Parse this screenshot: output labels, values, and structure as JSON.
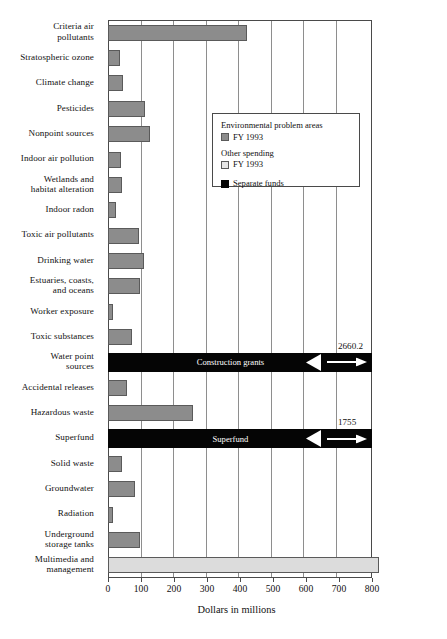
{
  "chart_data": {
    "type": "bar",
    "orientation": "horizontal",
    "title": "",
    "xlabel": "Dollars in millions",
    "ylabel": "",
    "xlim": [
      0,
      800
    ],
    "xticks": [
      0,
      100,
      200,
      300,
      400,
      500,
      600,
      700,
      800
    ],
    "xtick_labels": [
      "0",
      "100",
      "200",
      "300",
      "400",
      "500",
      "600",
      "700",
      "800"
    ],
    "grid": true,
    "legend_position": "upper-right-inside",
    "categories": [
      "Criteria air pollutants",
      "Stratospheric ozone",
      "Climate change",
      "Pesticides",
      "Nonpoint sources",
      "Indoor air pollution",
      "Wetlands and habitat alteration",
      "Indoor radon",
      "Toxic air pollutants",
      "Drinking water",
      "Estuaries, coasts, and oceans",
      "Worker exposure",
      "Toxic substances",
      "Water point sources",
      "Accidental releases",
      "Hazardous waste",
      "Superfund",
      "Solid waste",
      "Groundwater",
      "Radiation",
      "Underground storage tanks",
      "Multimedia and management"
    ],
    "values": [
      420,
      37,
      44,
      113,
      128,
      38,
      42,
      25,
      93,
      110,
      96,
      14,
      74,
      2660.2,
      58,
      258,
      1755,
      43,
      83,
      14,
      97,
      820
    ],
    "bars": [
      {
        "label_lines": [
          "Criteria air",
          "pollutants"
        ],
        "value": 420,
        "style": "dark",
        "broken": false
      },
      {
        "label_lines": [
          "Stratospheric ozone"
        ],
        "value": 37,
        "style": "dark",
        "broken": false
      },
      {
        "label_lines": [
          "Climate change"
        ],
        "value": 44,
        "style": "dark",
        "broken": false
      },
      {
        "label_lines": [
          "Pesticides"
        ],
        "value": 113,
        "style": "dark",
        "broken": false
      },
      {
        "label_lines": [
          "Nonpoint sources"
        ],
        "value": 128,
        "style": "dark",
        "broken": false
      },
      {
        "label_lines": [
          "Indoor air pollution"
        ],
        "value": 38,
        "style": "dark",
        "broken": false
      },
      {
        "label_lines": [
          "Wetlands and",
          "habitat alteration"
        ],
        "value": 42,
        "style": "dark",
        "broken": false
      },
      {
        "label_lines": [
          "Indoor radon"
        ],
        "value": 25,
        "style": "dark",
        "broken": false
      },
      {
        "label_lines": [
          "Toxic air pollutants"
        ],
        "value": 93,
        "style": "dark",
        "broken": false
      },
      {
        "label_lines": [
          "Drinking water"
        ],
        "value": 110,
        "style": "dark",
        "broken": false
      },
      {
        "label_lines": [
          "Estuaries, coasts,",
          "and oceans"
        ],
        "value": 96,
        "style": "dark",
        "broken": false
      },
      {
        "label_lines": [
          "Worker exposure"
        ],
        "value": 14,
        "style": "dark",
        "broken": false
      },
      {
        "label_lines": [
          "Toxic substances"
        ],
        "value": 74,
        "style": "dark",
        "broken": false
      },
      {
        "label_lines": [
          "Water point",
          "sources"
        ],
        "value": 2660.2,
        "style": "black",
        "broken": true,
        "bar_text": "Construction grants",
        "value_label": "2660.2"
      },
      {
        "label_lines": [
          "Accidental releases"
        ],
        "value": 58,
        "style": "dark",
        "broken": false
      },
      {
        "label_lines": [
          "Hazardous waste"
        ],
        "value": 258,
        "style": "dark",
        "broken": false
      },
      {
        "label_lines": [
          "Superfund"
        ],
        "value": 1755,
        "style": "black",
        "broken": true,
        "bar_text": "Superfund",
        "value_label": "1755"
      },
      {
        "label_lines": [
          "Solid waste"
        ],
        "value": 43,
        "style": "dark",
        "broken": false
      },
      {
        "label_lines": [
          "Groundwater"
        ],
        "value": 83,
        "style": "dark",
        "broken": false
      },
      {
        "label_lines": [
          "Radiation"
        ],
        "value": 14,
        "style": "dark",
        "broken": false
      },
      {
        "label_lines": [
          "Underground",
          "storage tanks"
        ],
        "value": 97,
        "style": "dark",
        "broken": false
      },
      {
        "label_lines": [
          "Multimedia and",
          "management"
        ],
        "value": 820,
        "style": "light",
        "broken": false
      }
    ],
    "colors": {
      "environmental_problem_areas": "#8c8c8c",
      "other_spending": "#dcdcdc",
      "separate_funds": "#050505",
      "axis": "#4a4a4a",
      "gridline": "#8e8e8e"
    },
    "legend": {
      "groups": [
        {
          "heading": "Environmental problem areas",
          "entries": [
            {
              "label": "FY 1993",
              "swatch": "dark"
            }
          ]
        },
        {
          "heading": "Other spending",
          "entries": [
            {
              "label": "FY 1993",
              "swatch": "light"
            }
          ]
        },
        {
          "heading": "",
          "entries": [
            {
              "label": "Separate funds",
              "swatch": "black"
            }
          ]
        }
      ]
    },
    "annotations": [
      {
        "text": "Construction grants",
        "on_bar": "Water point sources"
      },
      {
        "text": "2660.2",
        "on_bar": "Water point sources"
      },
      {
        "text": "Superfund",
        "on_bar": "Superfund"
      },
      {
        "text": "1755",
        "on_bar": "Superfund"
      }
    ]
  }
}
